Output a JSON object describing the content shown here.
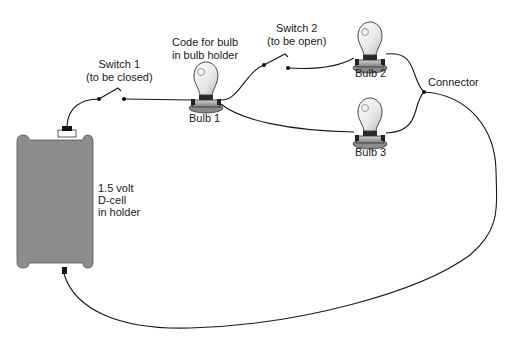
{
  "figure": {
    "truncated_header": "(cut off at top edge)",
    "labels": {
      "code_note": [
        "Code for bulb",
        "in bulb holder"
      ],
      "switch1": [
        "Switch 1",
        "(to be closed)"
      ],
      "switch2": [
        "Switch 2",
        "(to be open)"
      ],
      "bulb1": "Bulb 1",
      "bulb2": "Bulb 2",
      "bulb3": "Bulb 3",
      "connector": "Connector",
      "battery": [
        "1.5 volt",
        "D-cell",
        "in holder"
      ]
    },
    "components": [
      {
        "id": "battery",
        "type": "D-cell in holder",
        "voltage": "1.5 volt"
      },
      {
        "id": "switch1",
        "type": "switch",
        "state": "to be closed"
      },
      {
        "id": "bulb1",
        "type": "bulb in bulb holder"
      },
      {
        "id": "switch2",
        "type": "switch",
        "state": "to be open"
      },
      {
        "id": "bulb2",
        "type": "bulb in bulb holder"
      },
      {
        "id": "bulb3",
        "type": "bulb in bulb holder"
      },
      {
        "id": "connector",
        "type": "wire junction"
      }
    ],
    "colors": {
      "wire": "#1a1a1a",
      "battery_fill": "#8c8c8c",
      "battery_stroke": "#555555",
      "bulb_glass": "#f2f2f2",
      "bulb_base": "#9a9a9a"
    }
  }
}
